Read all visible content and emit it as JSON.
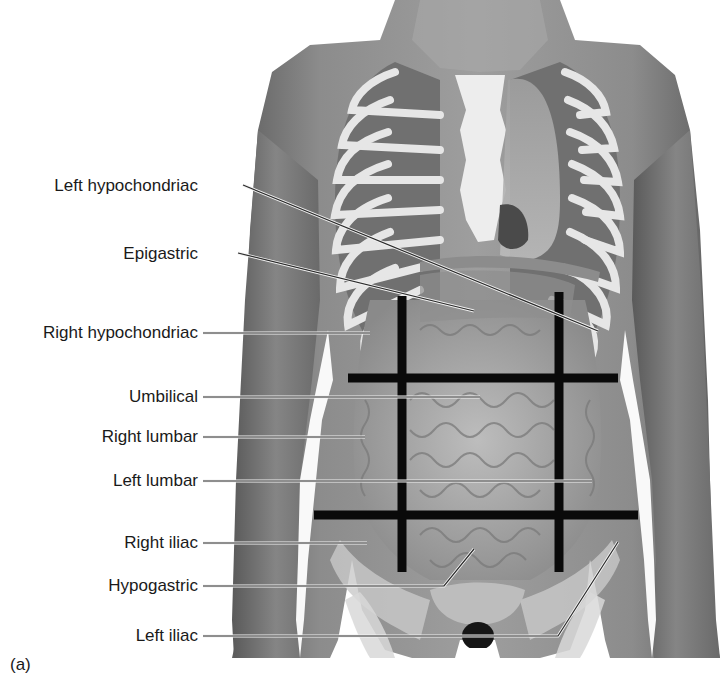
{
  "figure": {
    "panel_label": "(a)",
    "colors": {
      "background": "#ffffff",
      "skin_dark": "#6e6e6e",
      "skin_mid": "#8a8a8a",
      "skin_light": "#a8a8a8",
      "bone": "#e8e8e8",
      "organ": "#9c9c9c",
      "grid_line": "#0a0a0a",
      "leader_line": "#2a2a2a",
      "text": "#1a1a1a"
    }
  },
  "grid": {
    "vertical_lines": [
      {
        "x": 402,
        "y1": 296,
        "y2": 572
      },
      {
        "x": 559,
        "y1": 292,
        "y2": 572
      }
    ],
    "horizontal_lines": [
      {
        "y": 378,
        "x1": 348,
        "x2": 618
      },
      {
        "y": 515,
        "x1": 314,
        "x2": 638
      }
    ],
    "thickness": 9
  },
  "labels": [
    {
      "id": "left-hypochondriac",
      "text": "Left hypochondriac",
      "right": 198,
      "y": 186,
      "leader": {
        "x1": 243,
        "y1": 185,
        "x2": 598,
        "y2": 331
      }
    },
    {
      "id": "epigastric",
      "text": "Epigastric",
      "right": 198,
      "y": 254,
      "leader": {
        "x1": 238,
        "y1": 253,
        "x2": 474,
        "y2": 311
      }
    },
    {
      "id": "right-hypochondriac",
      "text": "Right hypochondriac",
      "right": 198,
      "y": 333,
      "leader": {
        "x1": 203,
        "y1": 333,
        "x2": 370,
        "y2": 333
      }
    },
    {
      "id": "umbilical",
      "text": "Umbilical",
      "right": 198,
      "y": 397,
      "leader": {
        "x1": 203,
        "y1": 397,
        "x2": 480,
        "y2": 397
      }
    },
    {
      "id": "right-lumbar",
      "text": "Right lumbar",
      "right": 198,
      "y": 437,
      "leader": {
        "x1": 203,
        "y1": 437,
        "x2": 365,
        "y2": 437
      }
    },
    {
      "id": "left-lumbar",
      "text": "Left lumbar",
      "right": 198,
      "y": 481,
      "leader": {
        "x1": 203,
        "y1": 481,
        "x2": 592,
        "y2": 481
      }
    },
    {
      "id": "right-iliac",
      "text": "Right iliac",
      "right": 198,
      "y": 543,
      "leader": {
        "x1": 203,
        "y1": 543,
        "x2": 367,
        "y2": 543
      }
    },
    {
      "id": "hypogastric",
      "text": "Hypogastric",
      "right": 198,
      "y": 586,
      "leader": {
        "x1": 203,
        "y1": 586,
        "x2": 444,
        "y2": 586,
        "x3": 474,
        "y3": 549
      }
    },
    {
      "id": "left-iliac",
      "text": "Left iliac",
      "right": 198,
      "y": 636,
      "leader": {
        "x1": 203,
        "y1": 636,
        "x2": 558,
        "y2": 636,
        "x3": 618,
        "y3": 542
      }
    }
  ]
}
